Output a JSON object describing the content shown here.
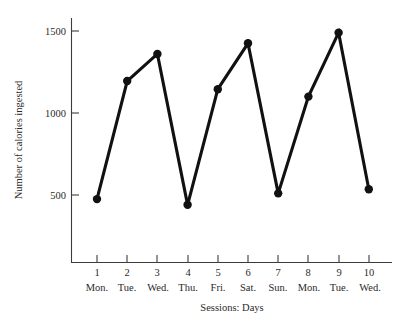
{
  "chart_data": {
    "type": "line",
    "title": "",
    "xlabel": "Sessions: Days",
    "ylabel": "Number of calories ingested",
    "x": [
      1,
      2,
      3,
      4,
      5,
      6,
      7,
      8,
      9,
      10
    ],
    "categories": [
      "Mon.",
      "Tue.",
      "Wed.",
      "Thu.",
      "Fri.",
      "Sat.",
      "Sun.",
      "Mon.",
      "Tue.",
      "Wed."
    ],
    "values": [
      475,
      1195,
      1360,
      440,
      1145,
      1425,
      510,
      1100,
      1490,
      535
    ],
    "series": [
      {
        "name": "Number of calories ingested",
        "values": [
          475,
          1195,
          1360,
          440,
          1145,
          1425,
          510,
          1100,
          1490,
          535
        ]
      }
    ],
    "x_tick_labels": [
      "1",
      "2",
      "3",
      "4",
      "5",
      "6",
      "7",
      "8",
      "9",
      "10"
    ],
    "x_day_labels": [
      "Mon.",
      "Tue.",
      "Wed.",
      "Thu.",
      "Fri.",
      "Sat.",
      "Sun.",
      "Mon.",
      "Tue.",
      "Wed."
    ],
    "y_tick_labels": [
      "500",
      "1000",
      "1500"
    ],
    "y_ticks": [
      500,
      1000,
      1500
    ],
    "ylim": [
      0,
      1620
    ],
    "xlim": [
      0.4,
      10.6
    ],
    "grid": false,
    "legend": false,
    "legend_position": "none",
    "marker": "filled-circle",
    "line_color": "#111111",
    "marker_color": "#111111",
    "axis_color": "#3c3c3c",
    "background_color": "#ffffff"
  },
  "axes": {
    "y_title": "Number of calories ingested",
    "x_title": "Sessions: Days"
  }
}
